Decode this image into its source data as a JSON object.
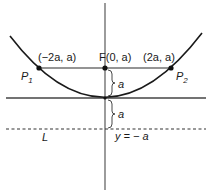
{
  "diagram": {
    "title": "",
    "colors": {
      "curve": "#1a1a1a",
      "axis": "#555555",
      "chord": "#2a2a2a",
      "directrix": "#333333",
      "text": "#1a1a1a"
    },
    "labels": {
      "left_point_coords": "(−2a, a)",
      "focus": "F(0, a)",
      "right_point_coords": "(2a, a)",
      "p1": "P",
      "p1_sub": "1",
      "p2": "P",
      "p2_sub": "2",
      "dist_upper": "a",
      "dist_lower": "a",
      "directrix_eq": "y = − a",
      "directrix_name": "L"
    },
    "points": [
      {
        "name": "P1",
        "coords": "(-2a, a)"
      },
      {
        "name": "F",
        "coords": "(0, a)"
      },
      {
        "name": "P2",
        "coords": "(2a, a)"
      }
    ],
    "elements": [
      "parabola",
      "x-axis",
      "y-axis",
      "focal chord",
      "directrix (dashed)",
      "distance braces"
    ]
  }
}
